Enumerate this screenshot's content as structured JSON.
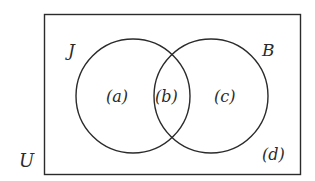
{
  "diagram": {
    "type": "venn",
    "universe": {
      "label": "U"
    },
    "sets": [
      {
        "label": "J"
      },
      {
        "label": "B"
      }
    ],
    "regions": [
      {
        "label": "(a)",
        "description": "J only"
      },
      {
        "label": "(b)",
        "description": "J and B"
      },
      {
        "label": "(c)",
        "description": "B only"
      },
      {
        "label": "(d)",
        "description": "neither J nor B"
      }
    ],
    "stroke_color": "#2b2b2b",
    "background_color": "#ffffff"
  }
}
